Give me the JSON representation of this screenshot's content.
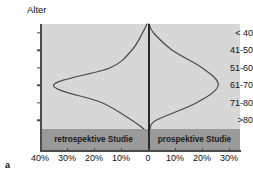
{
  "figure": {
    "panel_label": "a",
    "y_axis_title": "Alter"
  },
  "legend": {
    "left_label": "retrospektive Studie",
    "right_label": "prospektive Studie"
  },
  "chart_data": {
    "type": "line",
    "title": "",
    "subtitle": "",
    "xlabel": "",
    "ylabel": "Alter",
    "orientation": "horizontal-mirrored",
    "grid": false,
    "legend_position": "bottom-band",
    "categories": [
      "< 40",
      "41-50",
      "51-60",
      "61-70",
      "71-80",
      ">80"
    ],
    "x_tick_labels": [
      "40%",
      "30%",
      "20%",
      "10%",
      "0",
      "10%",
      "20%",
      "30%"
    ],
    "x_tick_values": [
      -40,
      -30,
      -20,
      -10,
      0,
      10,
      20,
      30
    ],
    "xlim": [
      -40,
      30
    ],
    "ylim_categories": 6,
    "series": [
      {
        "name": "retrospektive Studie",
        "side": "left",
        "color": "#4a4a4a",
        "categories": [
          "< 40",
          "41-50",
          "51-60",
          "61-70",
          "71-80",
          ">80"
        ],
        "values": [
          2,
          6,
          14,
          35,
          17,
          6
        ]
      },
      {
        "name": "prospektive Studie",
        "side": "right",
        "color": "#4a4a4a",
        "categories": [
          "< 40",
          "41-50",
          "51-60",
          "61-70",
          "71-80",
          ">80"
        ],
        "values": [
          2,
          9,
          20,
          26,
          18,
          3
        ]
      }
    ],
    "annotations": []
  },
  "colors": {
    "plot_background": "#d7d7d7",
    "legend_band": "#9a9a9a",
    "curve": "#4a4a4a",
    "axis": "#4a4a4a",
    "center_line": "#2a2a2a",
    "text": "#111111"
  }
}
